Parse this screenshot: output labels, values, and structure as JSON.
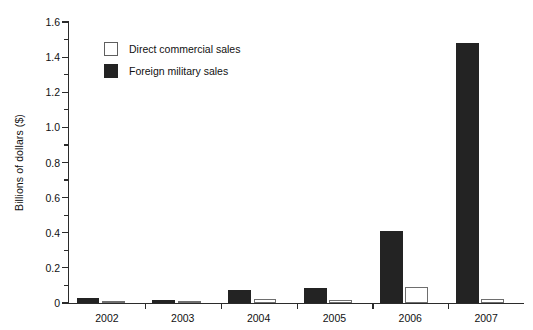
{
  "chart_data": {
    "type": "bar",
    "title": "",
    "xlabel": "",
    "ylabel": "Billions of dollars ($)",
    "categories": [
      "2002",
      "2003",
      "2004",
      "2005",
      "2006",
      "2007"
    ],
    "series": [
      {
        "name": "Direct commercial sales",
        "color": "#ffffff",
        "values": [
          0.005,
          0.004,
          0.025,
          0.018,
          0.09,
          0.025
        ]
      },
      {
        "name": "Foreign military sales",
        "color": "#232323",
        "values": [
          0.03,
          0.018,
          0.075,
          0.085,
          0.41,
          1.48
        ]
      }
    ],
    "ylim": [
      0,
      1.6
    ],
    "ytick_labels": [
      "0",
      "0.2",
      "0.4",
      "0.6",
      "0.8",
      "1.0",
      "1.2",
      "1.4",
      "1.6"
    ],
    "ytick_values": [
      0,
      0.2,
      0.4,
      0.6,
      0.8,
      1.0,
      1.2,
      1.4,
      1.6
    ],
    "yminor_values": [
      0.1,
      0.3,
      0.5,
      0.7,
      0.9,
      1.1,
      1.3,
      1.5
    ],
    "grid": false,
    "legend_position": "upper-left-inside"
  },
  "legend": {
    "items": [
      {
        "label": "Direct commercial sales",
        "swatch": "white-square-icon"
      },
      {
        "label": "Foreign military sales",
        "swatch": "black-square-icon"
      }
    ]
  }
}
